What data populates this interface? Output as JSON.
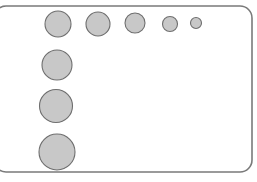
{
  "diagram": {
    "colors": {
      "background": "#ffffff",
      "frame_stroke": "#7a7a7a",
      "circle_fill": "#c8c8c8",
      "circle_stroke": "#6e6e6e"
    },
    "frame": {
      "x": -6,
      "y": 6,
      "width": 258,
      "height": 166,
      "radius": 12
    },
    "row_circles": [
      {
        "cx": 58,
        "cy": 24,
        "r": 13
      },
      {
        "cx": 98,
        "cy": 24,
        "r": 12
      },
      {
        "cx": 135,
        "cy": 23,
        "r": 10
      },
      {
        "cx": 170,
        "cy": 24,
        "r": 7.5
      },
      {
        "cx": 196,
        "cy": 23,
        "r": 5.5
      }
    ],
    "column_circles": [
      {
        "cx": 57,
        "cy": 65,
        "r": 15
      },
      {
        "cx": 56,
        "cy": 106,
        "r": 16.5
      },
      {
        "cx": 57,
        "cy": 152,
        "r": 18
      }
    ]
  }
}
